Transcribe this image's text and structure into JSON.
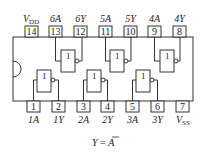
{
  "diagram": {
    "top_pins": [
      {
        "num": "14",
        "label": "V",
        "sub": "DD"
      },
      {
        "num": "13",
        "label": "6A",
        "sub": ""
      },
      {
        "num": "12",
        "label": "6Y",
        "sub": ""
      },
      {
        "num": "11",
        "label": "5A",
        "sub": ""
      },
      {
        "num": "10",
        "label": "5Y",
        "sub": ""
      },
      {
        "num": "9",
        "label": "4A",
        "sub": ""
      },
      {
        "num": "8",
        "label": "4Y",
        "sub": ""
      }
    ],
    "bottom_pins": [
      {
        "num": "1",
        "label": "1A",
        "sub": ""
      },
      {
        "num": "2",
        "label": "1Y",
        "sub": ""
      },
      {
        "num": "3",
        "label": "2A",
        "sub": ""
      },
      {
        "num": "4",
        "label": "2Y",
        "sub": ""
      },
      {
        "num": "5",
        "label": "3A",
        "sub": ""
      },
      {
        "num": "6",
        "label": "3Y",
        "sub": ""
      },
      {
        "num": "7",
        "label": "V",
        "sub": "SS"
      }
    ],
    "gate_symbol": "1",
    "formula": {
      "lhs": "Y",
      "eq": " = ",
      "rhs": "A"
    },
    "colors": {
      "line": "#333333",
      "background": "#ffffff"
    }
  }
}
